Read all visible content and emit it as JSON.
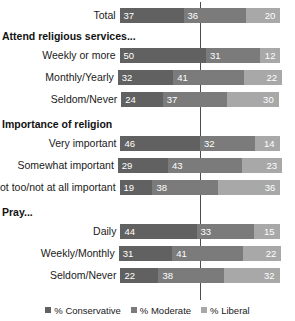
{
  "chart_data": {
    "type": "bar",
    "subtype": "stacked-horizontal",
    "title": "",
    "xlabel": "",
    "ylabel": "",
    "grid": false,
    "legend_position": "bottom",
    "series": [
      {
        "name": "% Conservative",
        "color": "#616161",
        "values": [
          37,
          50,
          32,
          24,
          46,
          29,
          19,
          44,
          31,
          22
        ]
      },
      {
        "name": "% Moderate",
        "color": "#7b7b7b",
        "values": [
          36,
          31,
          41,
          37,
          32,
          43,
          38,
          33,
          41,
          38
        ]
      },
      {
        "name": "% Liberal",
        "color": "#a8a8a8",
        "values": [
          20,
          12,
          22,
          30,
          14,
          23,
          36,
          15,
          22,
          32
        ]
      }
    ],
    "categories": [
      "Total",
      "Weekly or more",
      "Monthly/Yearly",
      "Seldom/Never",
      "Very important",
      "Somewhat important",
      "Not too/not at all important",
      "Daily",
      "Weekly/Monthly",
      "Seldom/Never"
    ],
    "group_headers": [
      "Attend religious services...",
      "Importance of religion",
      "Pray..."
    ]
  },
  "legend": {
    "items": [
      {
        "label": "% Conservative",
        "color": "#616161"
      },
      {
        "label": "% Moderate",
        "color": "#7b7b7b"
      },
      {
        "label": "% Liberal",
        "color": "#a8a8a8"
      }
    ]
  },
  "groups": [
    {
      "header": null,
      "rows": [
        {
          "label": "Total",
          "values": [
            37,
            36,
            20
          ]
        }
      ]
    },
    {
      "header": "Attend religious services...",
      "rows": [
        {
          "label": "Weekly or more",
          "values": [
            50,
            31,
            12
          ]
        },
        {
          "label": "Monthly/Yearly",
          "values": [
            32,
            41,
            22
          ]
        },
        {
          "label": "Seldom/Never",
          "values": [
            24,
            37,
            30
          ]
        }
      ]
    },
    {
      "header": "Importance of religion",
      "rows": [
        {
          "label": "Very important",
          "values": [
            46,
            32,
            14
          ]
        },
        {
          "label": "Somewhat important",
          "values": [
            29,
            43,
            23
          ]
        },
        {
          "label": "Not too/not at all important",
          "values": [
            19,
            38,
            36
          ]
        }
      ]
    },
    {
      "header": "Pray...",
      "rows": [
        {
          "label": "Daily",
          "values": [
            44,
            33,
            15
          ]
        },
        {
          "label": "Weekly/Monthly",
          "values": [
            31,
            41,
            22
          ]
        },
        {
          "label": "Seldom/Never",
          "values": [
            22,
            38,
            32
          ]
        }
      ]
    }
  ]
}
